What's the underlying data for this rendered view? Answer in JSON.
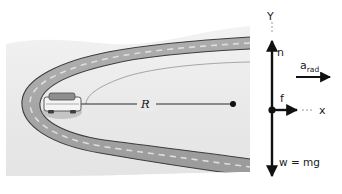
{
  "figure": {
    "background_color": "#ffffff"
  },
  "scene": {
    "name": "curved-road-perspective",
    "terrain_color": "#ebebeb",
    "road_color": "#a8a8a8",
    "road_edge_color": "#3a3a3a",
    "center_line_color": "#d8d8d8",
    "vehicle": {
      "name": "car",
      "body_color": "#f2f2f2",
      "window_color": "#888888",
      "outline_color": "#4a4a4a"
    },
    "radius": {
      "label": "R",
      "line_color": "#2a2a2a",
      "center_dot_color": "#111111"
    }
  },
  "free_body_diagram": {
    "axes": {
      "y_label": "Y",
      "x_label": "x",
      "axis_color": "#8a8a8a",
      "origin_dot_color": "#111111"
    },
    "vectors": [
      {
        "name": "normal-force",
        "label": "n",
        "direction": "up",
        "color": "#111111"
      },
      {
        "name": "friction-force",
        "label": "f",
        "direction": "right",
        "color": "#111111"
      },
      {
        "name": "weight-force",
        "label": "w = mg",
        "direction": "down",
        "color": "#111111"
      },
      {
        "name": "radial-acceleration",
        "label": "a",
        "label_subscript": "rad",
        "direction": "right",
        "color": "#111111"
      }
    ]
  }
}
